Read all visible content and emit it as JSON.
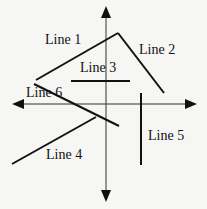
{
  "diagram": {
    "axes": {
      "horizontal": "x-axis",
      "vertical": "y-axis"
    },
    "lines": [
      {
        "name": "Line 1",
        "x1": 36,
        "y1": 80,
        "x2": 118,
        "y2": 33,
        "label_x": 45,
        "label_y": 33
      },
      {
        "name": "Line 2",
        "x1": 118,
        "y1": 33,
        "x2": 164,
        "y2": 93,
        "label_x": 139,
        "label_y": 43
      },
      {
        "name": "Line 3",
        "x1": 71,
        "y1": 81,
        "x2": 130,
        "y2": 81,
        "label_x": 80,
        "label_y": 61
      },
      {
        "name": "Line 4",
        "x1": 12,
        "y1": 164,
        "x2": 96,
        "y2": 117,
        "label_x": 46,
        "label_y": 148
      },
      {
        "name": "Line 5",
        "x1": 141,
        "y1": 93,
        "x2": 141,
        "y2": 165,
        "label_x": 148,
        "label_y": 129
      },
      {
        "name": "Line 6",
        "x1": 34,
        "y1": 84,
        "x2": 119,
        "y2": 126,
        "label_x": 26,
        "label_y": 86
      }
    ],
    "line_color": "#111111",
    "axis_color": "#333333"
  }
}
